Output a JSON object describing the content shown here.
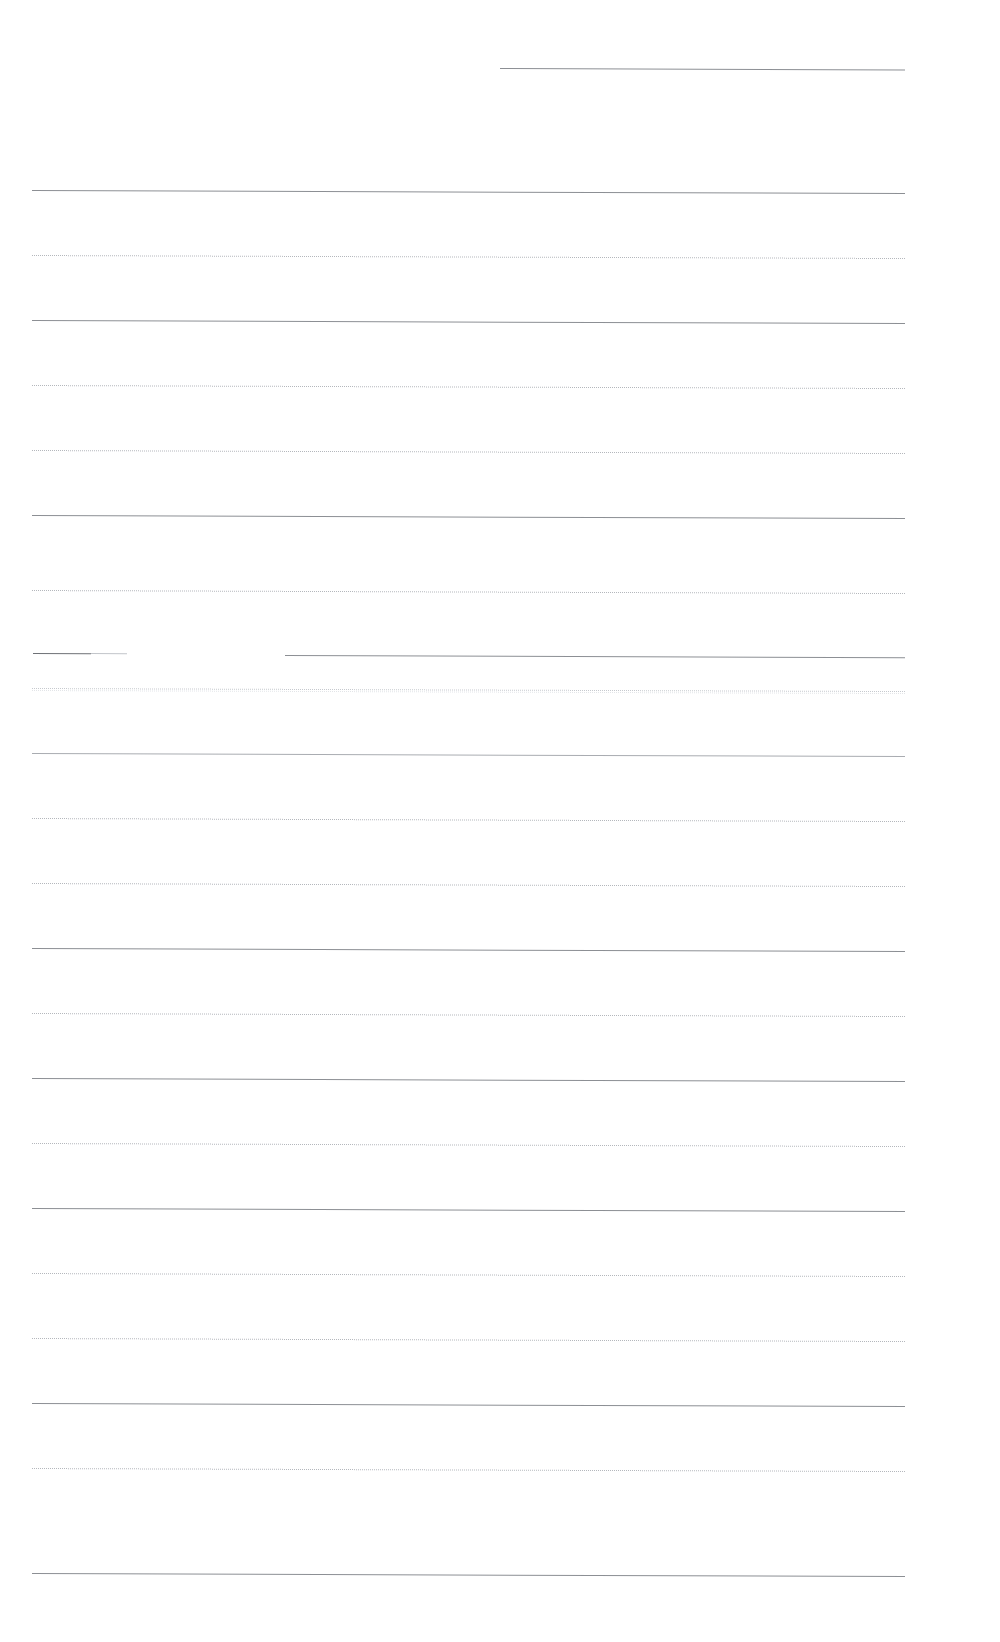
{
  "page": {
    "kind": "scanned-ruled-page",
    "width": 1000,
    "height": 1642,
    "background_color": "#ffffff",
    "text_content": "",
    "notes_visible": "none",
    "skew_degrees": 0.2
  },
  "style_palette": {
    "solid": "#8c8f94",
    "solid_soft": "#a9acb1",
    "dotted": "#b4b7bc",
    "dotted_soft": "#c6c9ce",
    "stub_dark": "#6e7176",
    "stub_fade": "#c2c5ca",
    "ghost": "#e3e5e8"
  },
  "layout": {
    "left_margin_x": 32,
    "right_margin_x": 905,
    "line_spacing": 65.3,
    "first_line_y": 68,
    "last_line_y": 1573,
    "line_count": 23
  },
  "rules": [
    {
      "id": 1,
      "y": 68,
      "x": 500,
      "width": 405,
      "variant": "solid",
      "label": "rule-line-1-partial"
    },
    {
      "id": 2,
      "y": 190,
      "x": 32,
      "width": 873,
      "variant": "solid",
      "label": "rule-line-2"
    },
    {
      "id": 3,
      "y": 255,
      "x": 32,
      "width": 873,
      "variant": "dotted",
      "label": "rule-line-3"
    },
    {
      "id": 4,
      "y": 320,
      "x": 32,
      "width": 873,
      "variant": "solid",
      "label": "rule-line-4"
    },
    {
      "id": 5,
      "y": 385,
      "x": 32,
      "width": 873,
      "variant": "dotted",
      "label": "rule-line-5"
    },
    {
      "id": 6,
      "y": 450,
      "x": 32,
      "width": 873,
      "variant": "dotted",
      "label": "rule-line-6"
    },
    {
      "id": 7,
      "y": 515,
      "x": 32,
      "width": 873,
      "variant": "solid",
      "label": "rule-line-7"
    },
    {
      "id": 8,
      "y": 590,
      "x": 32,
      "width": 873,
      "variant": "dotted",
      "label": "rule-line-8"
    },
    {
      "id": 9,
      "y": 655,
      "x": 285,
      "width": 620,
      "variant": "solid",
      "label": "rule-line-9-broken-main"
    },
    {
      "id": 10,
      "y": 688,
      "x": 32,
      "width": 873,
      "variant": "dotted-soft",
      "label": "rule-line-10"
    },
    {
      "id": 11,
      "y": 753,
      "x": 32,
      "width": 873,
      "variant": "solid-soft",
      "label": "rule-line-11"
    },
    {
      "id": 12,
      "y": 818,
      "x": 32,
      "width": 873,
      "variant": "dotted",
      "label": "rule-line-12"
    },
    {
      "id": 13,
      "y": 883,
      "x": 32,
      "width": 873,
      "variant": "dotted",
      "label": "rule-line-13"
    },
    {
      "id": 14,
      "y": 948,
      "x": 32,
      "width": 873,
      "variant": "solid",
      "label": "rule-line-14"
    },
    {
      "id": 15,
      "y": 1013,
      "x": 32,
      "width": 873,
      "variant": "dotted",
      "label": "rule-line-15"
    },
    {
      "id": 16,
      "y": 1078,
      "x": 32,
      "width": 873,
      "variant": "solid",
      "label": "rule-line-16"
    },
    {
      "id": 17,
      "y": 1143,
      "x": 32,
      "width": 873,
      "variant": "dotted",
      "label": "rule-line-17"
    },
    {
      "id": 18,
      "y": 1208,
      "x": 32,
      "width": 873,
      "variant": "solid",
      "label": "rule-line-18"
    },
    {
      "id": 19,
      "y": 1273,
      "x": 32,
      "width": 873,
      "variant": "dotted",
      "label": "rule-line-19"
    },
    {
      "id": 20,
      "y": 1338,
      "x": 32,
      "width": 873,
      "variant": "dotted",
      "label": "rule-line-20"
    },
    {
      "id": 21,
      "y": 1403,
      "x": 32,
      "width": 873,
      "variant": "solid",
      "label": "rule-line-21"
    },
    {
      "id": 22,
      "y": 1468,
      "x": 32,
      "width": 873,
      "variant": "dotted",
      "label": "rule-line-22"
    },
    {
      "id": 23,
      "y": 1573,
      "x": 32,
      "width": 873,
      "variant": "solid",
      "label": "rule-line-23"
    }
  ],
  "broken_line_segments": [
    {
      "id": "a",
      "y": 653,
      "x": 33,
      "width": 58,
      "variant": "stub",
      "label": "rule-line-9-stub-dark"
    },
    {
      "id": "b",
      "y": 653,
      "x": 91,
      "width": 36,
      "variant": "stub-fade",
      "label": "rule-line-9-stub-fade"
    }
  ]
}
